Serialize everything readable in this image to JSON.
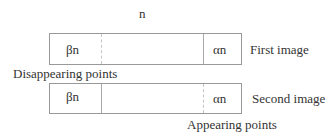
{
  "diagram": {
    "top_label": "n",
    "first_image": {
      "left_segment": "βn",
      "right_segment": "αn",
      "label": "First image",
      "left_divider": "dashed",
      "right_divider": "solid"
    },
    "disappearing_label": "Disappearing points",
    "second_image": {
      "left_segment": "βn",
      "right_segment": "αn",
      "label": "Second image",
      "left_divider": "solid",
      "right_divider": "dashed"
    },
    "appearing_label": "Appearing points"
  }
}
